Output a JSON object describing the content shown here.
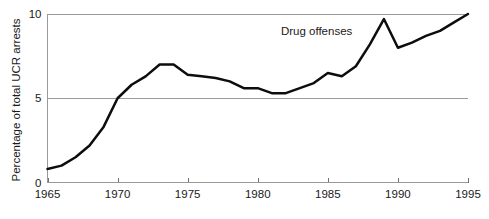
{
  "chart_data": {
    "type": "line",
    "title": "",
    "subtitle": "",
    "xlabel": "",
    "ylabel": "Percentage of total UCR arrests",
    "xlim": [
      1965,
      1995
    ],
    "ylim": [
      0,
      10
    ],
    "grid": "horizontal",
    "legend_position": "inline-annotation",
    "x_ticks": [
      "1965",
      "1970",
      "1975",
      "1980",
      "1985",
      "1990",
      "1995"
    ],
    "x_tick_values": [
      1965,
      1970,
      1975,
      1980,
      1985,
      1990,
      1995
    ],
    "y_ticks": [
      "0",
      "5",
      "10"
    ],
    "y_tick_values": [
      0,
      5,
      10
    ],
    "annotations": [
      {
        "text": "Drug offenses",
        "x": 1984.2,
        "y": 8.75
      }
    ],
    "series": [
      {
        "name": "Drug offenses",
        "color": "#0d0d0d",
        "x": [
          1965,
          1966,
          1967,
          1968,
          1969,
          1970,
          1971,
          1972,
          1973,
          1974,
          1975,
          1976,
          1977,
          1978,
          1979,
          1980,
          1981,
          1982,
          1983,
          1984,
          1985,
          1986,
          1987,
          1988,
          1989,
          1990,
          1991,
          1992,
          1993,
          1994,
          1995
        ],
        "values": [
          0.8,
          1.0,
          1.5,
          2.2,
          3.3,
          5.0,
          5.8,
          6.3,
          7.0,
          7.0,
          6.4,
          6.3,
          6.2,
          6.0,
          5.6,
          5.6,
          5.3,
          5.3,
          5.6,
          5.9,
          6.5,
          6.3,
          6.9,
          8.2,
          9.7,
          8.0,
          8.3,
          8.7,
          9.0,
          9.5,
          10.0
        ]
      }
    ]
  },
  "axes": {
    "y_axis_title": "Percentage of total UCR arrests"
  }
}
